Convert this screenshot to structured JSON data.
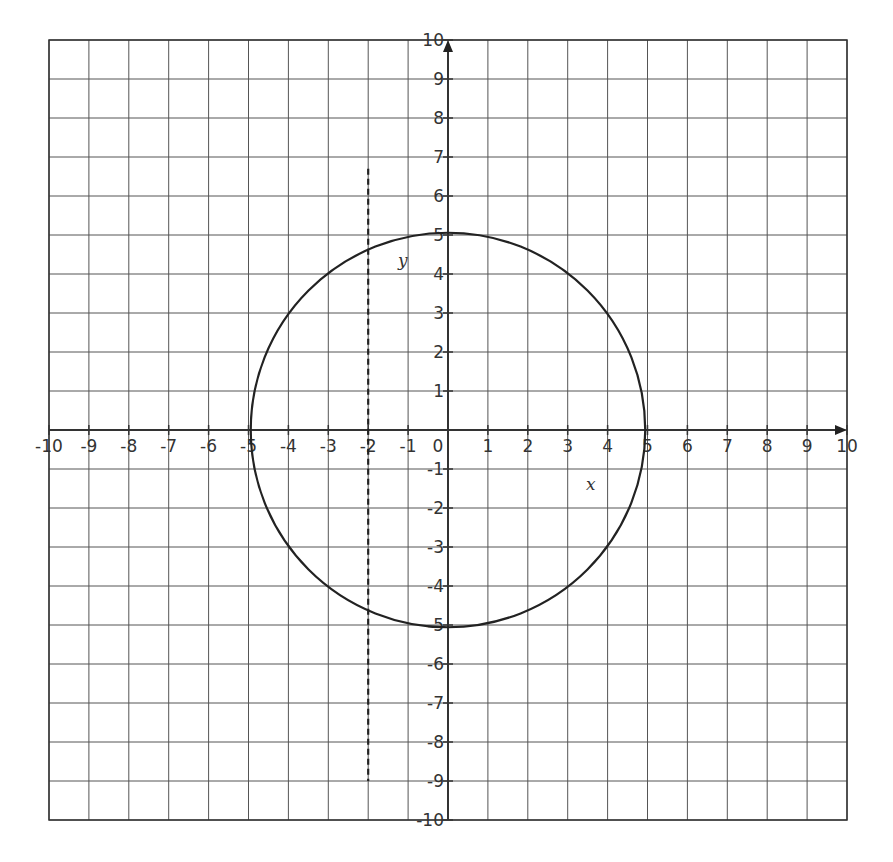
{
  "chart_data": {
    "type": "line",
    "title": "",
    "xlabel": "x",
    "ylabel": "y",
    "xlim": [
      -10,
      10
    ],
    "ylim": [
      -10,
      10
    ],
    "grid": true,
    "x_ticks": [
      "-10",
      "-9",
      "-8",
      "-7",
      "-6",
      "-5",
      "-4",
      "-3",
      "-2",
      "-1",
      "0",
      "1",
      "2",
      "3",
      "4",
      "5",
      "6",
      "7",
      "8",
      "9",
      "10"
    ],
    "y_ticks": [
      "10",
      "9",
      "8",
      "7",
      "6",
      "5",
      "4",
      "3",
      "2",
      "1",
      "-1",
      "-2",
      "-3",
      "-4",
      "-5",
      "-6",
      "-7",
      "-8",
      "-9",
      "-10"
    ],
    "series": [
      {
        "name": "circle",
        "style": "solid",
        "equation": "x^2 + y^2 = 25",
        "center": [
          0,
          0
        ],
        "radius": 5
      },
      {
        "name": "vertical line",
        "style": "dashed",
        "equation": "x = -2",
        "x": -2,
        "y_from": 6.7,
        "y_to": -9
      }
    ]
  },
  "labels": {
    "x_axis": "x",
    "y_axis": "y"
  }
}
